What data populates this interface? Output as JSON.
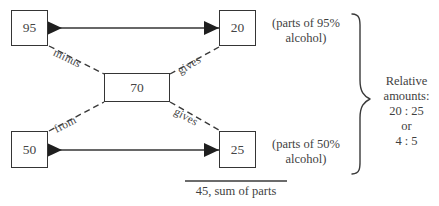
{
  "diagram": {
    "type": "alligation-mixture-diagram",
    "nodes": [
      {
        "id": "strong-concentration",
        "value": "95"
      },
      {
        "id": "weak-concentration",
        "value": "50"
      },
      {
        "id": "target-concentration",
        "value": "70"
      },
      {
        "id": "parts-strong",
        "value": "20"
      },
      {
        "id": "parts-weak",
        "value": "25"
      }
    ],
    "edge_labels": {
      "minus": "minus",
      "gives_top": "gives",
      "from": "from",
      "gives_bottom": "gives"
    },
    "annotations": {
      "top_note_line1": "(parts of 95%",
      "top_note_line2": "alcohol)",
      "bottom_note_line1": "(parts of 50%",
      "bottom_note_line2": "alcohol)",
      "sum_note": "45, sum of parts"
    },
    "relative_amounts": {
      "line1": "Relative",
      "line2": "amounts:",
      "line3": "20 : 25",
      "line4": "or",
      "line5": "4 : 5"
    },
    "colors": {
      "ink": "#353535",
      "text": "#3f3f3f",
      "background": "#ffffff"
    }
  }
}
